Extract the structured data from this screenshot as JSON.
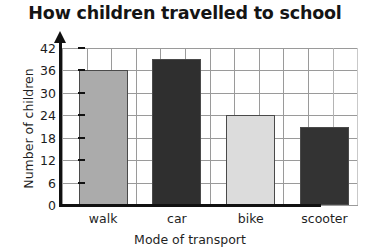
{
  "chart_data": {
    "type": "bar",
    "title": "How children travelled to school",
    "xlabel": "Mode of transport",
    "ylabel": "Number of children",
    "categories": [
      "walk",
      "car",
      "bike",
      "scooter"
    ],
    "values": [
      36,
      39,
      24,
      21
    ],
    "ylim": [
      0,
      42
    ],
    "yticks": [
      0,
      6,
      12,
      18,
      24,
      30,
      36,
      42
    ],
    "ytick_labels": [
      "0",
      "6",
      "12",
      "18",
      "24",
      "30",
      "36",
      "42"
    ],
    "grid": true,
    "legend": "none",
    "bar_colors": [
      "#ababab",
      "#2f2f2f",
      "#dcdcdc",
      "#333333"
    ],
    "bar_border_color": "#4a4a4a",
    "grid_color": "#9a9a9a",
    "axis_color": "#111111",
    "background": "#ffffff"
  }
}
